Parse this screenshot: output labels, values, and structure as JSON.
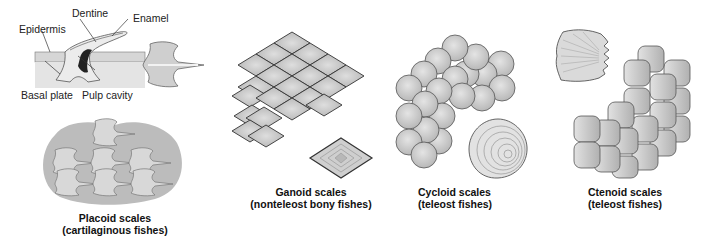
{
  "figure": {
    "panels": [
      {
        "id": "placoid",
        "caption_line1": "Placoid scales",
        "caption_line2": "(cartilaginous fishes)",
        "cross_section_labels": {
          "epidermis": "Epidermis",
          "dentine": "Dentine",
          "enamel": "Enamel",
          "basal_plate": "Basal plate",
          "pulp_cavity": "Pulp cavity"
        }
      },
      {
        "id": "ganoid",
        "caption_line1": "Ganoid scales",
        "caption_line2": "(nonteleost bony fishes)"
      },
      {
        "id": "cycloid",
        "caption_line1": "Cycloid scales",
        "caption_line2": "(teleost fishes)"
      },
      {
        "id": "ctenoid",
        "caption_line1": "Ctenoid scales",
        "caption_line2": "(teleost fishes)"
      }
    ]
  },
  "colors": {
    "scale_fill": "#c9c9c9",
    "scale_light": "#e6e6e6",
    "outline": "#444444",
    "skin_bg": "#bdbdbd",
    "pulp": "#222222"
  }
}
